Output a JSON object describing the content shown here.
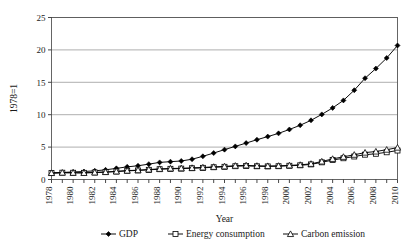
{
  "chart_data": {
    "type": "line",
    "title": "",
    "xlabel": "Year",
    "ylabel": "1978=1",
    "grid": true,
    "legend_position": "bottom",
    "xlim": [
      1978,
      2010
    ],
    "ylim": [
      0,
      25
    ],
    "yticks": [
      0,
      5,
      10,
      15,
      20,
      25
    ],
    "xticks": [
      1978,
      1980,
      1982,
      1984,
      1986,
      1988,
      1990,
      1992,
      1994,
      1996,
      1998,
      2000,
      2002,
      2004,
      2006,
      2008,
      2010
    ],
    "x": [
      1978,
      1979,
      1980,
      1981,
      1982,
      1983,
      1984,
      1985,
      1986,
      1987,
      1988,
      1989,
      1990,
      1991,
      1992,
      1993,
      1994,
      1995,
      1996,
      1997,
      1998,
      1999,
      2000,
      2001,
      2002,
      2003,
      2004,
      2005,
      2006,
      2007,
      2008,
      2009,
      2010
    ],
    "series": [
      {
        "name": "GDP",
        "marker": "filled-diamond",
        "color": "#000000",
        "values": [
          1.0,
          1.08,
          1.17,
          1.23,
          1.34,
          1.49,
          1.72,
          1.95,
          2.12,
          2.37,
          2.64,
          2.75,
          2.86,
          3.13,
          3.58,
          4.08,
          4.61,
          5.11,
          5.62,
          6.14,
          6.62,
          7.12,
          7.72,
          8.37,
          9.13,
          10.05,
          11.05,
          12.21,
          13.78,
          15.63,
          17.12,
          18.75,
          20.68
        ]
      },
      {
        "name": "Energy consumption",
        "marker": "open-square",
        "color": "#000000",
        "values": [
          1.0,
          1.05,
          1.04,
          1.03,
          1.08,
          1.14,
          1.23,
          1.34,
          1.4,
          1.49,
          1.59,
          1.65,
          1.68,
          1.74,
          1.8,
          1.89,
          1.96,
          2.05,
          2.1,
          2.04,
          2.02,
          2.05,
          2.12,
          2.19,
          2.33,
          2.65,
          3.0,
          3.28,
          3.55,
          3.83,
          3.97,
          4.2,
          4.47
        ]
      },
      {
        "name": "Carbon emission",
        "marker": "open-triangle",
        "color": "#000000",
        "values": [
          1.0,
          1.06,
          1.04,
          1.02,
          1.09,
          1.15,
          1.25,
          1.37,
          1.44,
          1.54,
          1.64,
          1.7,
          1.73,
          1.79,
          1.86,
          1.95,
          2.03,
          2.13,
          2.18,
          2.11,
          2.08,
          2.11,
          2.18,
          2.26,
          2.42,
          2.78,
          3.18,
          3.5,
          3.82,
          4.15,
          4.32,
          4.6,
          4.92
        ]
      }
    ]
  },
  "axes": {
    "y_title": "1978=1",
    "x_title": "Year"
  },
  "legend": {
    "items": [
      {
        "label": "GDP",
        "marker": "filled-diamond"
      },
      {
        "label": "Energy consumption",
        "marker": "open-square"
      },
      {
        "label": "Carbon emission",
        "marker": "open-triangle"
      }
    ]
  }
}
